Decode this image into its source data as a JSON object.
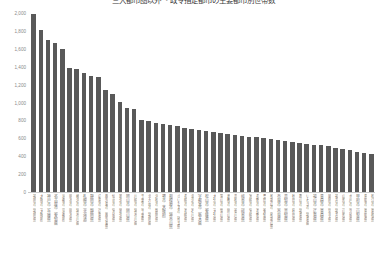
{
  "chart": {
    "title": "三大都市圏以外 ・政令指定都市の主要都市別世帯数",
    "bar_color": "#595959",
    "axis_label_color": "#8a8a8a",
    "background": "#ffffff"
  },
  "chart_data": {
    "type": "bar",
    "title": "三大都市圏以外 ・政令指定都市の主要都市別世帯数",
    "xlabel": "",
    "ylabel": "",
    "ylim": [
      0,
      2000
    ],
    "yticks": [
      0,
      200,
      400,
      600,
      800,
      1000,
      1200,
      1400,
      1600,
      1800,
      2000
    ],
    "ytick_labels": [
      "0",
      "200",
      "400",
      "600",
      "800",
      "1,000",
      "1,200",
      "1,400",
      "1,600",
      "1,800",
      "2,000"
    ],
    "grid": false,
    "legend": null,
    "orientation": "vertical",
    "categories": [
      "福岡市（福岡県）",
      "大阪市（大阪府）",
      "神戸市（兵庫県）",
      "名古屋市（愛知県）",
      "京都市（京都府）",
      "熊本市（熊本県）",
      "横浜市（神奈川県）",
      "札幌市（北海道）",
      "静岡市（静岡県）",
      "広島市（広島県）",
      "鹿児島市（鹿児島県）",
      "仙台市（宮城県）",
      "新潟市（新潟県）",
      "岡山市（岡山県）",
      "川崎市（神奈川県）",
      "千葉市（千葉県）",
      "北九州市（福岡県）",
      "浜松市（静岡県）",
      "堺市（大阪府）",
      "相模原市（神奈川県）",
      "さいたま市（埼玉県）",
      "長崎市（長崎県）",
      "金沢市（石川県）",
      "宇都宮市（栃木県）",
      "松山市（愛媛県）",
      "大分市（大分県）",
      "富山市（富山県）",
      "倉敷市（岡山県）",
      "高松市（香川県）",
      "岐阜市（岐阜県）",
      "宮崎市（宮崎県）",
      "長野市（長野県）",
      "豊田市（愛知県）",
      "和歌山市（和歌山県）",
      "奈良市（奈良県）",
      "高知市（高知県）",
      "秋田市（秋田県）",
      "郡山市（福島県）",
      "いわき市（福島県）",
      "福山市（広島県）",
      "青森市（青森県）",
      "盛岡市（岩手県）",
      "福井市（福井県）",
      "山形市（山形県）",
      "水戸市（茨城県）",
      "甲府市（山梨県）",
      "鳥取市（鳥取県）",
      "松江市（島根県）"
    ],
    "values": [
      1990,
      1810,
      1700,
      1660,
      1600,
      1390,
      1370,
      1330,
      1300,
      1290,
      1140,
      1100,
      1010,
      940,
      930,
      800,
      790,
      770,
      760,
      750,
      740,
      710,
      700,
      690,
      680,
      670,
      660,
      650,
      640,
      630,
      620,
      610,
      600,
      590,
      580,
      570,
      560,
      550,
      540,
      530,
      520,
      510,
      490,
      480,
      470,
      450,
      440,
      430
    ]
  }
}
